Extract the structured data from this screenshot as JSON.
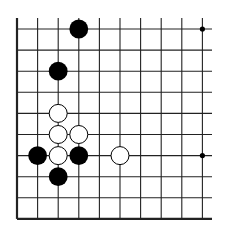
{
  "diagram": {
    "type": "go-board-corner",
    "board_color": "#ffffff",
    "line_color": "#222222",
    "grid": {
      "columns": 10,
      "rows": 10,
      "origin_x": 17,
      "origin_y": 29,
      "spacing_x": 20.6,
      "spacing_y": 21.1,
      "left_edge": true,
      "bottom_edge": true,
      "open_top_extent": 18,
      "open_right_extent": 212
    },
    "star_points": [
      {
        "col": 9,
        "row": 0
      },
      {
        "col": 9,
        "row": 6
      }
    ],
    "stones": [
      {
        "color": "black",
        "col": 3,
        "row": 0
      },
      {
        "color": "black",
        "col": 2,
        "row": 2
      },
      {
        "color": "white",
        "col": 2,
        "row": 4
      },
      {
        "color": "white",
        "col": 2,
        "row": 5
      },
      {
        "color": "white",
        "col": 3,
        "row": 5
      },
      {
        "color": "black",
        "col": 1,
        "row": 6
      },
      {
        "color": "white",
        "col": 2,
        "row": 6
      },
      {
        "color": "black",
        "col": 3,
        "row": 6
      },
      {
        "color": "white",
        "col": 5,
        "row": 6
      },
      {
        "color": "black",
        "col": 2,
        "row": 7
      }
    ]
  }
}
